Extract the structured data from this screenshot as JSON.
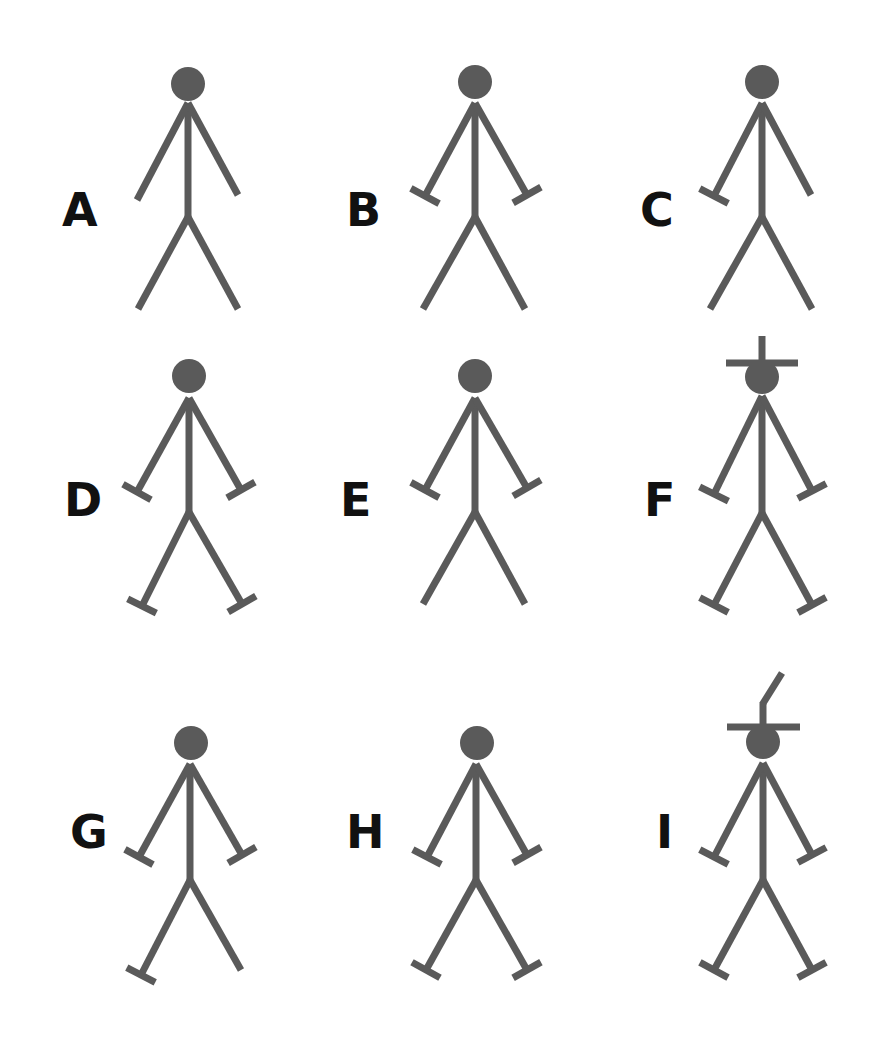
{
  "style": {
    "figure_color": "#5a5a5a",
    "label_color": "#111111",
    "background": "#ffffff",
    "stroke_width": 7,
    "head_radius": 17,
    "bar_half_length": 16
  },
  "figures": [
    {
      "label": "A",
      "label_x": 62,
      "label_y": 210,
      "head": [
        188,
        84
      ],
      "neck": [
        188,
        103
      ],
      "hip": [
        188,
        217
      ],
      "hands": [
        [
          137,
          200
        ],
        [
          238,
          195
        ]
      ],
      "feet": [
        [
          138,
          309
        ],
        [
          238,
          309
        ]
      ],
      "hand_bars": [
        false,
        false
      ],
      "foot_bars": [
        false,
        false
      ],
      "hat": "none"
    },
    {
      "label": "B",
      "label_x": 346,
      "label_y": 210,
      "head": [
        475,
        82
      ],
      "neck": [
        475,
        103
      ],
      "hip": [
        475,
        217
      ],
      "hands": [
        [
          425,
          196
        ],
        [
          527,
          195
        ]
      ],
      "feet": [
        [
          423,
          309
        ],
        [
          525,
          309
        ]
      ],
      "hand_bars": [
        true,
        true
      ],
      "foot_bars": [
        false,
        false
      ],
      "hat": "none"
    },
    {
      "label": "C",
      "label_x": 640,
      "label_y": 210,
      "head": [
        762,
        82
      ],
      "neck": [
        762,
        103
      ],
      "hip": [
        762,
        217
      ],
      "hands": [
        [
          714,
          196
        ],
        [
          811,
          195
        ]
      ],
      "feet": [
        [
          710,
          309
        ],
        [
          812,
          309
        ]
      ],
      "hand_bars": [
        true,
        false
      ],
      "foot_bars": [
        false,
        false
      ],
      "hat": "none"
    },
    {
      "label": "D",
      "label_x": 64,
      "label_y": 500,
      "head": [
        189,
        376
      ],
      "neck": [
        189,
        398
      ],
      "hip": [
        189,
        512
      ],
      "hands": [
        [
          137,
          492
        ],
        [
          241,
          490
        ]
      ],
      "feet": [
        [
          142,
          606
        ],
        [
          242,
          604
        ]
      ],
      "hand_bars": [
        true,
        true
      ],
      "foot_bars": [
        true,
        true
      ],
      "hat": "none"
    },
    {
      "label": "E",
      "label_x": 340,
      "label_y": 500,
      "head": [
        475,
        376
      ],
      "neck": [
        475,
        398
      ],
      "hip": [
        475,
        512
      ],
      "hands": [
        [
          425,
          490
        ],
        [
          527,
          488
        ]
      ],
      "feet": [
        [
          423,
          604
        ],
        [
          525,
          604
        ]
      ],
      "hand_bars": [
        true,
        true
      ],
      "foot_bars": [
        false,
        false
      ],
      "hat": "none"
    },
    {
      "label": "F",
      "label_x": 644,
      "label_y": 500,
      "head": [
        762,
        377
      ],
      "neck": [
        762,
        396
      ],
      "hip": [
        762,
        513
      ],
      "hands": [
        [
          714,
          494
        ],
        [
          812,
          491
        ]
      ],
      "feet": [
        [
          714,
          605
        ],
        [
          812,
          605
        ]
      ],
      "hand_bars": [
        true,
        true
      ],
      "foot_bars": [
        true,
        true
      ],
      "hat": "cross"
    },
    {
      "label": "G",
      "label_x": 70,
      "label_y": 832,
      "head": [
        191,
        743
      ],
      "neck": [
        190,
        764
      ],
      "hip": [
        190,
        880
      ],
      "hands": [
        [
          139,
          857
        ],
        [
          242,
          855
        ]
      ],
      "feet": [
        [
          141,
          975
        ],
        [
          241,
          970
        ]
      ],
      "hand_bars": [
        true,
        true
      ],
      "foot_bars": [
        true,
        false
      ],
      "hat": "none"
    },
    {
      "label": "H",
      "label_x": 346,
      "label_y": 832,
      "head": [
        477,
        743
      ],
      "neck": [
        476,
        764
      ],
      "hip": [
        476,
        880
      ],
      "hands": [
        [
          427,
          857
        ],
        [
          527,
          855
        ]
      ],
      "feet": [
        [
          426,
          970
        ],
        [
          527,
          970
        ]
      ],
      "hand_bars": [
        true,
        true
      ],
      "foot_bars": [
        true,
        true
      ],
      "hat": "none"
    },
    {
      "label": "I",
      "label_x": 656,
      "label_y": 832,
      "head": [
        763,
        742
      ],
      "neck": [
        763,
        763
      ],
      "hip": [
        763,
        880
      ],
      "hands": [
        [
          714,
          857
        ],
        [
          812,
          855
        ]
      ],
      "feet": [
        [
          714,
          970
        ],
        [
          812,
          970
        ]
      ],
      "hand_bars": [
        true,
        true
      ],
      "foot_bars": [
        true,
        true
      ],
      "hat": "feather"
    }
  ]
}
